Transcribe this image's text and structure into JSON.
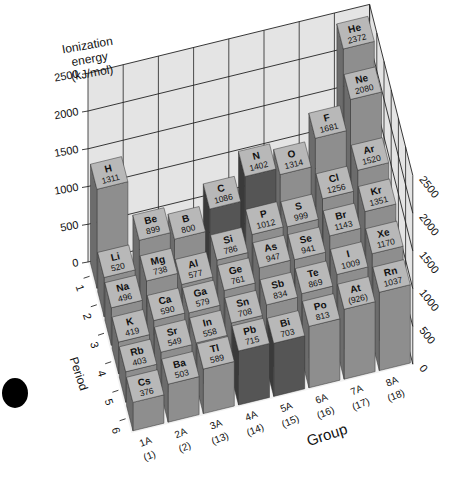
{
  "chart_data": {
    "type": "bar3d",
    "title": "",
    "zlabel": "Ionization energy (kJ/mol)",
    "xlabel": "Group",
    "ylabel": "Period",
    "zlim": [
      0,
      2500
    ],
    "z_ticks": [
      "0",
      "500",
      "1000",
      "1500",
      "2000",
      "2500"
    ],
    "period_ticks": [
      "1",
      "2",
      "3",
      "4",
      "5",
      "6"
    ],
    "group_ticks": [
      {
        "top": "1A",
        "bottom": "(1)"
      },
      {
        "top": "2A",
        "bottom": "(2)"
      },
      {
        "top": "3A",
        "bottom": "(13)"
      },
      {
        "top": "4A",
        "bottom": "(14)"
      },
      {
        "top": "5A",
        "bottom": "(15)"
      },
      {
        "top": "6A",
        "bottom": "(16)"
      },
      {
        "top": "7A",
        "bottom": "(17)"
      },
      {
        "top": "8A",
        "bottom": "(18)"
      }
    ],
    "grid": true,
    "elements": [
      {
        "symbol": "H",
        "value": "1311",
        "energy": 1311,
        "group": 0,
        "period": 1
      },
      {
        "symbol": "He",
        "value": "2372",
        "energy": 2372,
        "group": 7,
        "period": 1
      },
      {
        "symbol": "Li",
        "value": "520",
        "energy": 520,
        "group": 0,
        "period": 2
      },
      {
        "symbol": "Be",
        "value": "899",
        "energy": 899,
        "group": 1,
        "period": 2
      },
      {
        "symbol": "B",
        "value": "800",
        "energy": 800,
        "group": 2,
        "period": 2
      },
      {
        "symbol": "C",
        "value": "1086",
        "energy": 1086,
        "group": 3,
        "period": 2
      },
      {
        "symbol": "N",
        "value": "1402",
        "energy": 1402,
        "group": 4,
        "period": 2
      },
      {
        "symbol": "O",
        "value": "1314",
        "energy": 1314,
        "group": 5,
        "period": 2
      },
      {
        "symbol": "F",
        "value": "1681",
        "energy": 1681,
        "group": 6,
        "period": 2
      },
      {
        "symbol": "Ne",
        "value": "2080",
        "energy": 2080,
        "group": 7,
        "period": 2
      },
      {
        "symbol": "Na",
        "value": "496",
        "energy": 496,
        "group": 0,
        "period": 3
      },
      {
        "symbol": "Mg",
        "value": "738",
        "energy": 738,
        "group": 1,
        "period": 3
      },
      {
        "symbol": "Al",
        "value": "577",
        "energy": 577,
        "group": 2,
        "period": 3
      },
      {
        "symbol": "Si",
        "value": "786",
        "energy": 786,
        "group": 3,
        "period": 3
      },
      {
        "symbol": "P",
        "value": "1012",
        "energy": 1012,
        "group": 4,
        "period": 3
      },
      {
        "symbol": "S",
        "value": "999",
        "energy": 999,
        "group": 5,
        "period": 3
      },
      {
        "symbol": "Cl",
        "value": "1256",
        "energy": 1256,
        "group": 6,
        "period": 3
      },
      {
        "symbol": "Ar",
        "value": "1520",
        "energy": 1520,
        "group": 7,
        "period": 3
      },
      {
        "symbol": "K",
        "value": "419",
        "energy": 419,
        "group": 0,
        "period": 4
      },
      {
        "symbol": "Ca",
        "value": "590",
        "energy": 590,
        "group": 1,
        "period": 4
      },
      {
        "symbol": "Ga",
        "value": "579",
        "energy": 579,
        "group": 2,
        "period": 4
      },
      {
        "symbol": "Ge",
        "value": "761",
        "energy": 761,
        "group": 3,
        "period": 4
      },
      {
        "symbol": "As",
        "value": "947",
        "energy": 947,
        "group": 4,
        "period": 4
      },
      {
        "symbol": "Se",
        "value": "941",
        "energy": 941,
        "group": 5,
        "period": 4
      },
      {
        "symbol": "Br",
        "value": "1143",
        "energy": 1143,
        "group": 6,
        "period": 4
      },
      {
        "symbol": "Kr",
        "value": "1351",
        "energy": 1351,
        "group": 7,
        "period": 4
      },
      {
        "symbol": "Rb",
        "value": "403",
        "energy": 403,
        "group": 0,
        "period": 5
      },
      {
        "symbol": "Sr",
        "value": "549",
        "energy": 549,
        "group": 1,
        "period": 5
      },
      {
        "symbol": "In",
        "value": "558",
        "energy": 558,
        "group": 2,
        "period": 5
      },
      {
        "symbol": "Sn",
        "value": "708",
        "energy": 708,
        "group": 3,
        "period": 5
      },
      {
        "symbol": "Sb",
        "value": "834",
        "energy": 834,
        "group": 4,
        "period": 5
      },
      {
        "symbol": "Te",
        "value": "869",
        "energy": 869,
        "group": 5,
        "period": 5
      },
      {
        "symbol": "I",
        "value": "1009",
        "energy": 1009,
        "group": 6,
        "period": 5
      },
      {
        "symbol": "Xe",
        "value": "1170",
        "energy": 1170,
        "group": 7,
        "period": 5
      },
      {
        "symbol": "Cs",
        "value": "376",
        "energy": 376,
        "group": 0,
        "period": 6
      },
      {
        "symbol": "Ba",
        "value": "503",
        "energy": 503,
        "group": 1,
        "period": 6
      },
      {
        "symbol": "Tl",
        "value": "589",
        "energy": 589,
        "group": 2,
        "period": 6
      },
      {
        "symbol": "Pb",
        "value": "715",
        "energy": 715,
        "group": 3,
        "period": 6
      },
      {
        "symbol": "Bi",
        "value": "703",
        "energy": 703,
        "group": 4,
        "period": 6
      },
      {
        "symbol": "Po",
        "value": "813",
        "energy": 813,
        "group": 5,
        "period": 6
      },
      {
        "symbol": "At",
        "value": "(926)",
        "energy": 926,
        "group": 6,
        "period": 6
      },
      {
        "symbol": "Rn",
        "value": "1037",
        "energy": 1037,
        "group": 7,
        "period": 6
      }
    ]
  },
  "labels": {
    "zlabel_line1": "Ionization",
    "zlabel_line2": "energy",
    "zlabel_line3": "(kJ/mol)",
    "xlabel": "Group",
    "ylabel": "Period"
  },
  "colors": {
    "top_face": "#b8b8b8",
    "front_face": "#8e8e8e",
    "side_face": "#6c6c6c",
    "dark_front": "#555555",
    "dark_side": "#3a3a3a",
    "grid_wall": "#e4e4e4",
    "grid_line": "#222222"
  }
}
